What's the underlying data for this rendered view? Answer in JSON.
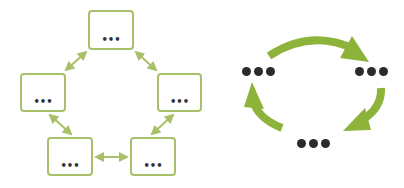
{
  "colors": {
    "box_border": "#a9c06a",
    "connector": "#a9c06a",
    "cycle_arrow": "#8db33a",
    "dots": "#2b2b2b"
  },
  "network_diagram": {
    "nodes": [
      {
        "id": "top",
        "label": "•••"
      },
      {
        "id": "left",
        "label": "•••"
      },
      {
        "id": "right",
        "label": "•••"
      },
      {
        "id": "bottom-left",
        "label": "•••"
      },
      {
        "id": "bottom-right",
        "label": "•••"
      }
    ],
    "edges": [
      {
        "from": "top",
        "to": "left",
        "type": "bidirectional"
      },
      {
        "from": "top",
        "to": "right",
        "type": "bidirectional"
      },
      {
        "from": "left",
        "to": "bottom-left",
        "type": "bidirectional"
      },
      {
        "from": "right",
        "to": "bottom-right",
        "type": "bidirectional"
      },
      {
        "from": "bottom-left",
        "to": "bottom-right",
        "type": "bidirectional"
      }
    ]
  },
  "cycle_diagram": {
    "nodes": [
      {
        "id": "left",
        "label": "•••"
      },
      {
        "id": "right",
        "label": "•••"
      },
      {
        "id": "bottom",
        "label": "•••"
      }
    ],
    "arrows": [
      {
        "from": "left",
        "to": "right",
        "direction": "clockwise"
      },
      {
        "from": "right",
        "to": "bottom",
        "direction": "clockwise"
      },
      {
        "from": "bottom",
        "to": "left",
        "direction": "clockwise"
      }
    ]
  }
}
